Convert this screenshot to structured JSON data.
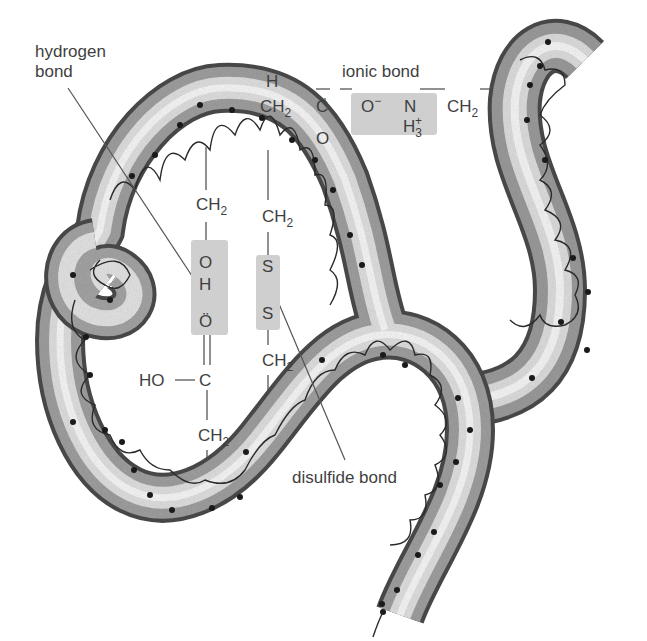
{
  "diagram": {
    "labels": {
      "hydrogen_bond_line1": "hydrogen",
      "hydrogen_bond_line2": "bond",
      "ionic_bond": "ionic bond",
      "disulfide_bond": "disulfide bond"
    },
    "chemistry": {
      "ionic_chain": {
        "h_top": "H",
        "ch2_left": "CH",
        "ch2_left_sub": "2",
        "c": "C",
        "o_double": "O",
        "o_minus": "O",
        "o_minus_sup": "−",
        "n": "N",
        "h3": "H",
        "h3_sub": "3",
        "h3_sup": "+",
        "ch2_right": "CH",
        "ch2_right_sub": "2"
      },
      "hydrogen_chain": {
        "ch2_top": "CH",
        "ch2_top_sub": "2",
        "o": "O",
        "h": "H",
        "o_lone_pair": "Ö",
        "c": "C",
        "ho": "HO",
        "ch2_bottom": "CH",
        "ch2_bottom_sub": "2"
      },
      "disulfide_chain": {
        "ch2_top": "CH",
        "ch2_top_sub": "2",
        "s_top": "S",
        "s_bottom": "S",
        "ch2_bottom": "CH",
        "ch2_bottom_sub": "2"
      }
    },
    "colors": {
      "background": "#ffffff",
      "tube_light": "#f2f2f2",
      "tube_mid": "#b5b5b5",
      "tube_dark": "#4a4a4a",
      "chain_line": "#2a2a2a",
      "highlight_box": "#cfcfcf",
      "text": "#3f3f3f"
    }
  }
}
